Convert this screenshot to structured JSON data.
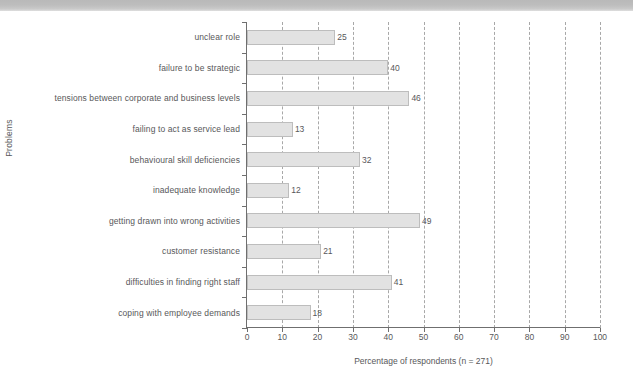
{
  "figure": {
    "caption_banner_text": "",
    "background_color": "#ffffff",
    "bar_fill_color": "#e2e2e2",
    "bar_border_color": "#bdbdbd",
    "gridline_color": "#a8a8a8",
    "axis_color": "#6f6f6f",
    "text_color": "#58585a"
  },
  "chart_data": {
    "type": "bar",
    "orientation": "horizontal",
    "title": "",
    "xlabel": "Percentage of respondents (n = 271)",
    "ylabel": "Problems",
    "xlim": [
      0,
      100
    ],
    "xticks": [
      0,
      10,
      20,
      30,
      40,
      50,
      60,
      70,
      80,
      90,
      100
    ],
    "xticklabels": [
      "0",
      "10",
      "20",
      "30",
      "40",
      "50",
      "60",
      "70",
      "80",
      "90",
      "100"
    ],
    "grid": "vertical-dashed",
    "legend": "none",
    "sample_size": 271,
    "categories": [
      "unclear role",
      "failure to be strategic",
      "tensions between corporate and business levels",
      "failing to act as service lead",
      "behavioural skill deficiencies",
      "inadequate knowledge",
      "getting drawn into wrong activities",
      "customer resistance",
      "difficulties in finding right staff",
      "coping with employee demands"
    ],
    "values": [
      25,
      40,
      46,
      13,
      32,
      12,
      49,
      21,
      41,
      18
    ],
    "value_labels": [
      "25",
      "40",
      "46",
      "13",
      "32",
      "12",
      "49",
      "21",
      "41",
      "18"
    ]
  }
}
